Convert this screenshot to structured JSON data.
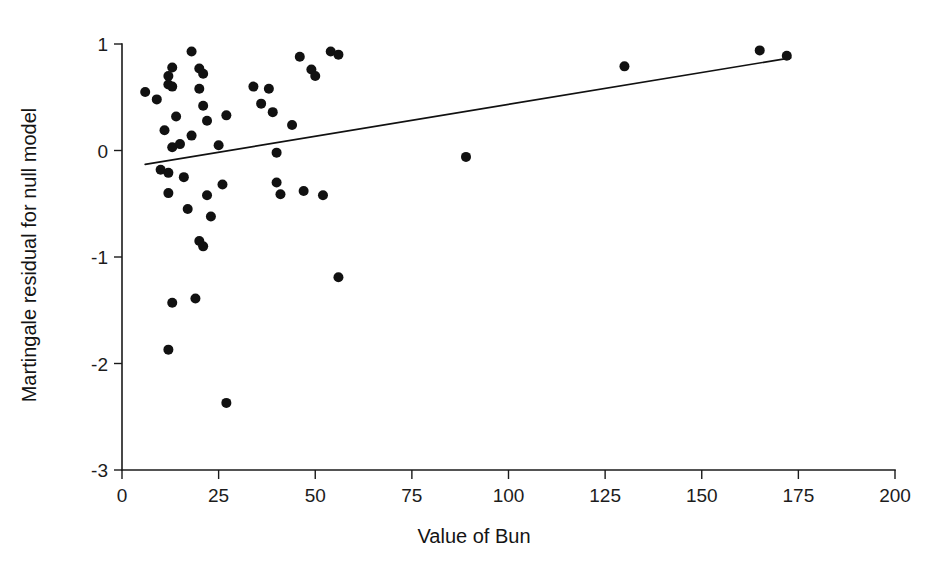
{
  "figure": {
    "background_color": "#ffffff",
    "point_color": "#111111",
    "line_color": "#111111",
    "axis_color": "#1a1a1a"
  },
  "chart_data": {
    "type": "scatter",
    "title": "",
    "xlabel": "Value of Bun",
    "ylabel": "Martingale residual for null model",
    "xlim": [
      0,
      200
    ],
    "ylim": [
      -3,
      1
    ],
    "xticks": [
      0,
      25,
      50,
      75,
      100,
      125,
      150,
      175,
      200
    ],
    "xtick_labels": [
      "0",
      "25",
      "50",
      "75",
      "100",
      "125",
      "150",
      "175",
      "200"
    ],
    "yticks": [
      1,
      0,
      -1,
      -2,
      -3
    ],
    "ytick_labels": [
      "1",
      "0",
      "-1",
      "-2",
      "-3"
    ],
    "grid": false,
    "legend": null,
    "x": [
      6,
      9,
      10,
      11,
      12,
      12,
      12,
      12,
      12,
      13,
      13,
      13,
      13,
      14,
      15,
      16,
      17,
      18,
      18,
      19,
      20,
      20,
      20,
      21,
      21,
      21,
      22,
      22,
      23,
      25,
      26,
      27,
      27,
      34,
      36,
      38,
      39,
      40,
      40,
      41,
      44,
      46,
      47,
      49,
      50,
      52,
      54,
      56,
      56,
      89,
      130,
      165,
      172
    ],
    "y": [
      0.55,
      0.48,
      -0.18,
      0.19,
      0.7,
      0.62,
      -0.21,
      -0.4,
      -1.87,
      0.78,
      0.6,
      0.03,
      -1.43,
      0.32,
      0.06,
      -0.25,
      -0.55,
      0.93,
      0.14,
      -1.39,
      0.77,
      0.58,
      -0.85,
      0.72,
      0.42,
      -0.9,
      0.28,
      -0.42,
      -0.62,
      0.05,
      -0.32,
      -2.37,
      0.33,
      0.6,
      0.44,
      0.58,
      0.36,
      -0.3,
      -0.02,
      -0.41,
      0.24,
      0.88,
      -0.38,
      0.76,
      0.7,
      -0.42,
      0.93,
      -1.19,
      0.9,
      -0.06,
      0.79,
      0.94,
      0.89
    ],
    "series": [
      {
        "name": "Martingale residuals",
        "marker": "filled-circle",
        "marker_size": 5
      }
    ],
    "fit_line": {
      "name": "Smoothed trend",
      "x_start": 6,
      "y_start": -0.13,
      "x_end": 173,
      "y_end": 0.87
    }
  }
}
